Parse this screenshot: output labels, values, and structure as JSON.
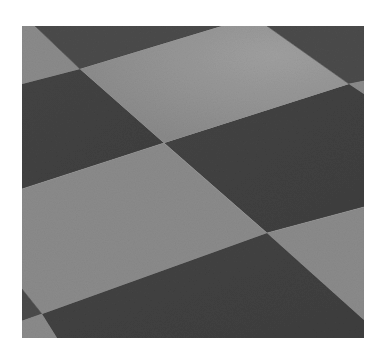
{
  "image": {
    "subject": "checkerboard plane in perspective",
    "colors": {
      "background": "#ffffff",
      "light_tile": "#8b8b8b",
      "light_tile_highlight": "#9c9c9c",
      "dark_tile": "#4b4b4b",
      "dark_tile_deep": "#404040"
    },
    "viewbox": "0 0 342 312",
    "tiles": [
      {
        "name": "tile-top-left-light-wedge",
        "tone": "light",
        "points": "0,0 13,0 58,43 0,58"
      },
      {
        "name": "tile-top-dark-band",
        "tone": "dark",
        "points": "13,0 200,0 58,43"
      },
      {
        "name": "tile-top-light",
        "tone": "highlight",
        "points": "200,0 245,0 327,58 142,117 58,43"
      },
      {
        "name": "tile-top-right-dark",
        "tone": "dark",
        "points": "245,0 342,0 342,55 327,58"
      },
      {
        "name": "tile-right-light-sliver",
        "tone": "light",
        "points": "327,58 342,55 342,68"
      },
      {
        "name": "tile-left-dark",
        "tone": "deep",
        "points": "0,58 58,43 142,117 0,163"
      },
      {
        "name": "tile-middle-right-dark",
        "tone": "deep",
        "points": "142,117 327,58 342,68 342,181 245,207"
      },
      {
        "name": "tile-large-light",
        "tone": "light",
        "points": "0,163 142,117 245,207 20,288 0,263"
      },
      {
        "name": "tile-left-dark-wedge",
        "tone": "dark",
        "points": "0,263 20,288 0,295"
      },
      {
        "name": "tile-bottom-left-light",
        "tone": "light",
        "points": "0,295 20,288 35,312 0,312"
      },
      {
        "name": "tile-right-light",
        "tone": "light",
        "points": "245,207 342,181 342,294"
      },
      {
        "name": "tile-bottom-dark",
        "tone": "deep",
        "points": "20,288 245,207 342,294 342,312 35,312"
      }
    ]
  }
}
